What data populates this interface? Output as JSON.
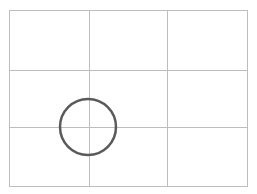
{
  "diagram": {
    "type": "rule-of-thirds-grid",
    "frame": {
      "x": 9,
      "y": 10,
      "width": 238,
      "height": 176
    },
    "vertical_lines": [
      89,
      167
    ],
    "horizontal_lines": [
      70,
      127
    ],
    "grid_color": "#bdbdbd",
    "focal_circle": {
      "cx": 88,
      "cy": 127,
      "r": 28,
      "stroke": "#5a5a5a",
      "stroke_width": 2.5
    }
  }
}
